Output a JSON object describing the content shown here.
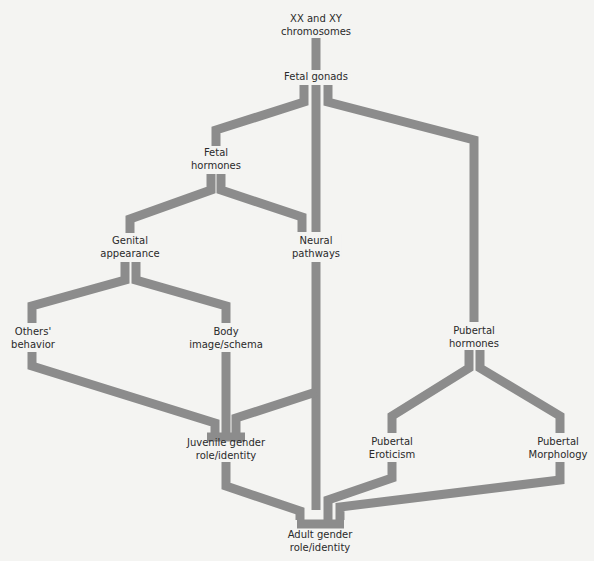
{
  "diagram": {
    "link_color": "#8c8c8c",
    "background": "#f4f4f2",
    "nodes": {
      "chromosomes": {
        "line1": "XX and XY",
        "line2": "chromosomes"
      },
      "fetal_gonads": {
        "line1": "Fetal gonads",
        "line2": ""
      },
      "fetal_hormones": {
        "line1": "Fetal",
        "line2": "hormones"
      },
      "genital_appearance": {
        "line1": "Genital",
        "line2": "appearance"
      },
      "neural_pathways": {
        "line1": "Neural",
        "line2": "pathways"
      },
      "others_behavior": {
        "line1": "Others'",
        "line2": "behavior"
      },
      "body_image": {
        "line1": "Body",
        "line2": "image/schema"
      },
      "pubertal_hormones": {
        "line1": "Pubertal",
        "line2": "hormones"
      },
      "juvenile_gender": {
        "line1": "Juvenile gender",
        "line2": "role/identity"
      },
      "pubertal_eroticism": {
        "line1": "Pubertal",
        "line2": "Eroticism"
      },
      "pubertal_morphology": {
        "line1": "Pubertal",
        "line2": "Morphology"
      },
      "adult_gender": {
        "line1": "Adult gender",
        "line2": "role/identity"
      }
    },
    "edges": [
      {
        "from": "XX and XY chromosomes",
        "to": "Fetal gonads"
      },
      {
        "from": "Fetal gonads",
        "to": "Fetal hormones"
      },
      {
        "from": "Fetal gonads",
        "to": "Neural pathways"
      },
      {
        "from": "Fetal gonads",
        "to": "Pubertal hormones"
      },
      {
        "from": "Fetal hormones",
        "to": "Genital appearance"
      },
      {
        "from": "Fetal hormones",
        "to": "Neural pathways"
      },
      {
        "from": "Genital appearance",
        "to": "Others' behavior"
      },
      {
        "from": "Genital appearance",
        "to": "Body image/schema"
      },
      {
        "from": "Others' behavior",
        "to": "Juvenile gender role/identity"
      },
      {
        "from": "Body image/schema",
        "to": "Juvenile gender role/identity"
      },
      {
        "from": "Neural pathways",
        "to": "Juvenile gender role/identity"
      },
      {
        "from": "Neural pathways",
        "to": "Adult gender role/identity"
      },
      {
        "from": "Juvenile gender role/identity",
        "to": "Adult gender role/identity"
      },
      {
        "from": "Pubertal hormones",
        "to": "Pubertal Eroticism"
      },
      {
        "from": "Pubertal hormones",
        "to": "Pubertal Morphology"
      },
      {
        "from": "Pubertal Eroticism",
        "to": "Adult gender role/identity"
      },
      {
        "from": "Pubertal Morphology",
        "to": "Adult gender role/identity"
      }
    ]
  }
}
